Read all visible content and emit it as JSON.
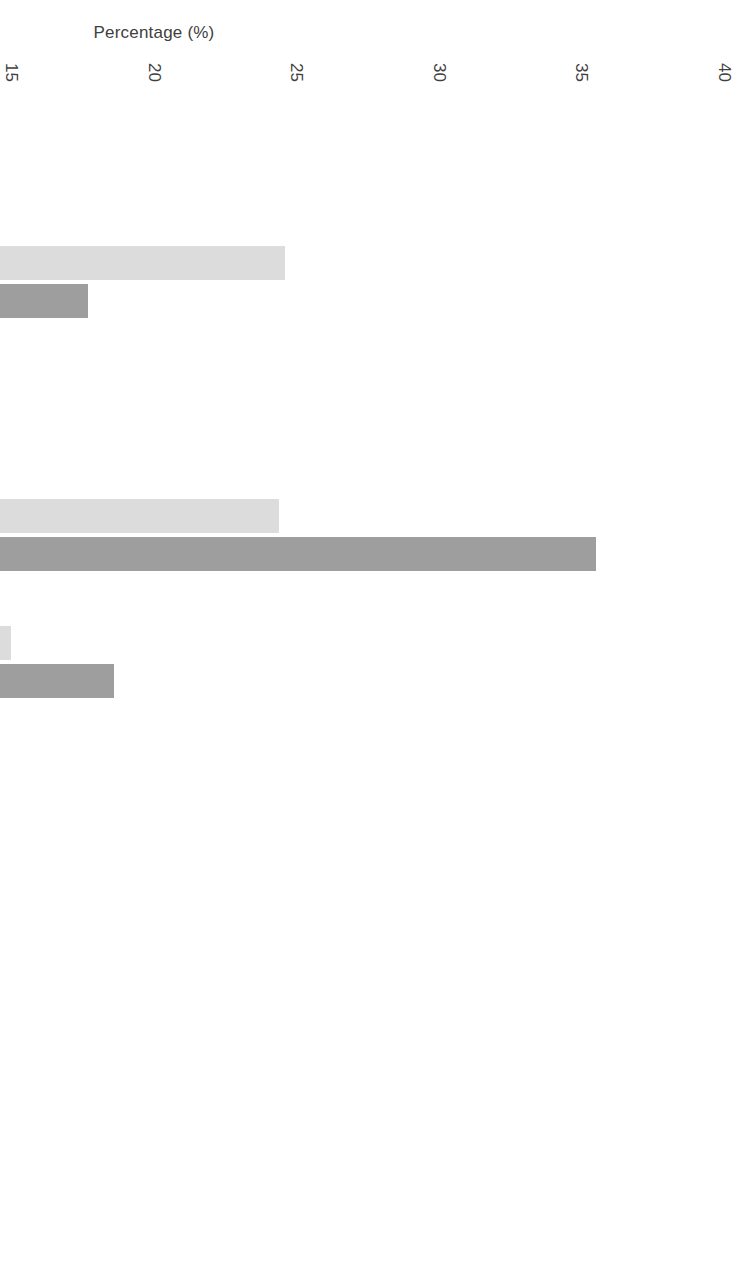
{
  "chart_data": {
    "type": "bar",
    "orientation": "vertical",
    "title": "",
    "xlabel": "",
    "ylabel": "Percentage (%)",
    "ylim": [
      0,
      40
    ],
    "ytick_step": 5,
    "yticks": [
      "0",
      "5",
      "10",
      "15",
      "20",
      "25",
      "30",
      "35",
      "40"
    ],
    "grid": false,
    "legend_position": "bottom",
    "categories": [
      "No Degree or\nCertificate",
      "High School",
      "Apprenticeship\nor Trade",
      "University\nCertificate\nor Diploma below\nBachelor's",
      "Bachelor's\nDegree",
      "University Certificate\nor Diploma above\nBachelor's",
      "Degree in\nMedicine,\nDentistry,\nVeterinary\nMedicine, or\nOptometry",
      "Master's\nDegree",
      "PhD"
    ],
    "series": [
      {
        "name": "Men",
        "color": "#dcdcdc",
        "values": [
          9.6,
          24.6,
          10.0,
          24.4,
          15.0,
          3.0,
          0.8,
          7.6,
          0.7
        ]
      },
      {
        "name": "Women",
        "color": "#9e9e9e",
        "values": [
          7.0,
          17.7,
          10.1,
          35.5,
          18.6,
          4.2,
          0.7,
          6.5,
          1.0
        ]
      }
    ]
  },
  "legend": {
    "items": [
      {
        "label": "Men",
        "swatch": "men-swatch-icon"
      },
      {
        "label": "Women",
        "swatch": "women-swatch-icon"
      }
    ]
  },
  "axis": {
    "y_title": "Percentage (%)"
  }
}
